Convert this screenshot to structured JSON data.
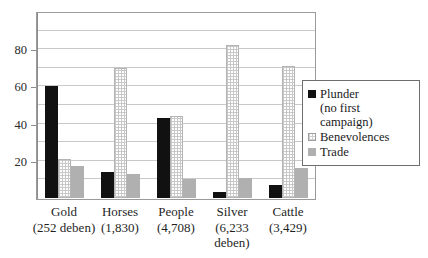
{
  "chart_data": {
    "type": "bar",
    "title": "",
    "subtitle": "",
    "xlabel": "",
    "ylabel": "",
    "ylim": [
      0,
      100
    ],
    "yticks": [
      20,
      40,
      60,
      80
    ],
    "ytick_labels": [
      "20",
      "40",
      "60",
      "80"
    ],
    "grid": true,
    "grid_interval": 10,
    "legend_position": "right",
    "categories": [
      "Gold",
      "Horses",
      "People",
      "Silver",
      "Cattle"
    ],
    "category_sublabels": [
      "(252 deben)",
      "(1,830)",
      "(4,708)",
      "(6,233 deben)",
      "(3,429)"
    ],
    "series": [
      {
        "name": "Plunder (no first campaign)",
        "values": [
          60,
          14,
          43,
          3,
          7
        ],
        "color": "#111111"
      },
      {
        "name": "Benevolences",
        "values": [
          21,
          70,
          44,
          82,
          71
        ],
        "color": "#e8e8e8"
      },
      {
        "name": "Trade",
        "values": [
          17,
          13,
          10,
          11,
          16
        ],
        "color": "#b0b0b0"
      }
    ]
  },
  "axis": {
    "y_labels": [
      {
        "value": 80,
        "text": "80"
      },
      {
        "value": 60,
        "text": "60"
      },
      {
        "value": 40,
        "text": "40"
      },
      {
        "value": 20,
        "text": "20"
      }
    ]
  },
  "categories": [
    {
      "name": "Gold",
      "sub1": "(252 deben)",
      "sub2": ""
    },
    {
      "name": "Horses",
      "sub1": "(1,830)",
      "sub2": ""
    },
    {
      "name": "People",
      "sub1": "(4,708)",
      "sub2": ""
    },
    {
      "name": "Silver",
      "sub1": "(6,233",
      "sub2": "deben)"
    },
    {
      "name": "Cattle",
      "sub1": "(3,429)",
      "sub2": ""
    }
  ],
  "legend": {
    "items": [
      {
        "label": "Plunder",
        "continuation": "(no first campaign)",
        "swatch": "plunder-swatch"
      },
      {
        "label": "Benevolences",
        "continuation": "",
        "swatch": "benevolences-swatch"
      },
      {
        "label": "Trade",
        "continuation": "",
        "swatch": "trade-swatch"
      }
    ]
  }
}
